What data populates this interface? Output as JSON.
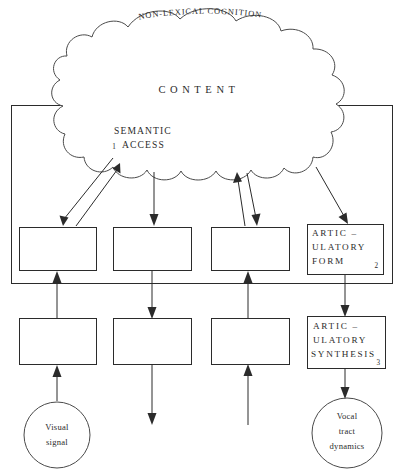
{
  "diagram": {
    "title": "NON-LEXICAL COGNITION",
    "cloud": {
      "name": "non-lexical-cognition-cloud",
      "arc_label": "NON-LEXICAL COGNITION",
      "center_label": "CONTENT",
      "lobe_label_line1": "SEMANTIC",
      "lobe_label_line2": "ACCESS",
      "lobe_marker": "1"
    },
    "row1": {
      "boxes": [
        {
          "name": "row1-box-1",
          "lines": [],
          "marker": ""
        },
        {
          "name": "row1-box-2",
          "lines": [],
          "marker": ""
        },
        {
          "name": "row1-box-3",
          "lines": [],
          "marker": ""
        },
        {
          "name": "articulatory-form-box",
          "line1": "ARTIC –",
          "line2": "ULATORY",
          "line3": "FORM",
          "marker": "2"
        }
      ]
    },
    "row2": {
      "boxes": [
        {
          "name": "row2-box-1",
          "lines": [],
          "marker": ""
        },
        {
          "name": "row2-box-2",
          "lines": [],
          "marker": ""
        },
        {
          "name": "row2-box-3",
          "lines": [],
          "marker": ""
        },
        {
          "name": "articulatory-synthesis-box",
          "line1": "ARTIC –",
          "line2": "ULATORY",
          "line3": "SYNTHESIS",
          "marker": "3"
        }
      ]
    },
    "circles": {
      "left": {
        "name": "visual-signal-circle",
        "line1": "Visual",
        "line2": "signal"
      },
      "right": {
        "name": "vocal-tract-dynamics-circle",
        "line1": "Vocal",
        "line2": "tract",
        "line3": "dynamics"
      }
    },
    "colors": {
      "ink": "#2b2b2b",
      "light_ink": "#4a4a4a",
      "paper": "#ffffff"
    }
  }
}
